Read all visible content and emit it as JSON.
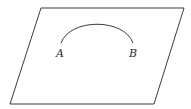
{
  "diagram": {
    "plane": {
      "points": [
        [
          41,
          8
        ],
        [
          184,
          8
        ],
        [
          154,
          104
        ],
        [
          10,
          104
        ]
      ],
      "stroke": "#3a3a3a"
    },
    "arc": {
      "start": [
        61,
        43
      ],
      "end": [
        133,
        43
      ],
      "peak": [
        97,
        23
      ],
      "stroke": "#3a3a3a"
    },
    "labels": [
      {
        "text": "A",
        "x": 56,
        "y": 57
      },
      {
        "text": "B",
        "x": 129,
        "y": 57
      }
    ]
  }
}
